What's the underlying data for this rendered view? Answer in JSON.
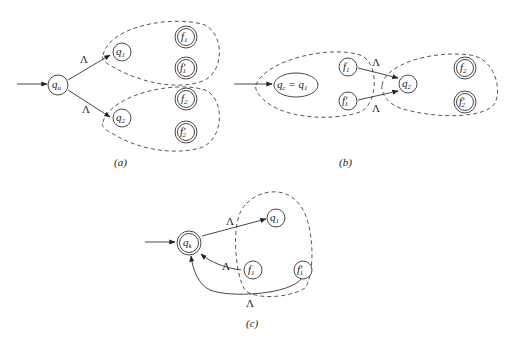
{
  "figure": {
    "panels": [
      {
        "id": "a",
        "caption": "(a)",
        "states": [
          {
            "id": "qu",
            "label": "q",
            "sub": "u",
            "type": "initial"
          },
          {
            "id": "q1",
            "label": "q",
            "sub": "1",
            "type": "normal"
          },
          {
            "id": "q2",
            "label": "q",
            "sub": "2",
            "type": "normal"
          },
          {
            "id": "f1",
            "label": "f",
            "sub": "1",
            "type": "accepting"
          },
          {
            "id": "f1p",
            "label": "f′",
            "sub": "1",
            "type": "accepting"
          },
          {
            "id": "f2",
            "label": "f",
            "sub": "2",
            "type": "accepting"
          },
          {
            "id": "f2p",
            "label": "f′",
            "sub": "2",
            "type": "accepting"
          }
        ],
        "transitions": [
          {
            "from": "qu",
            "to": "q1",
            "label": "Λ"
          },
          {
            "from": "qu",
            "to": "q2",
            "label": "Λ"
          }
        ],
        "groups": [
          "M1 (q1, f1, f1′)",
          "M2 (q2, f2, f2′)"
        ]
      },
      {
        "id": "b",
        "caption": "(b)",
        "states": [
          {
            "id": "qc",
            "label": "q",
            "sub": "c",
            "eq": "= q",
            "eqsub": "1",
            "type": "initial"
          },
          {
            "id": "f1",
            "label": "f",
            "sub": "1",
            "type": "normal"
          },
          {
            "id": "f1p",
            "label": "f′",
            "sub": "1",
            "type": "normal"
          },
          {
            "id": "q2",
            "label": "q",
            "sub": "2",
            "type": "normal"
          },
          {
            "id": "f2",
            "label": "f",
            "sub": "2",
            "type": "accepting"
          },
          {
            "id": "f2p",
            "label": "f′",
            "sub": "2",
            "type": "accepting"
          }
        ],
        "transitions": [
          {
            "from": "f1",
            "to": "q2",
            "label": "Λ"
          },
          {
            "from": "f1p",
            "to": "q2",
            "label": "Λ"
          }
        ],
        "groups": [
          "M1 (qc=q1, f1, f1′)",
          "M2 (q2, f2, f2′)"
        ]
      },
      {
        "id": "c",
        "caption": "(c)",
        "states": [
          {
            "id": "qk",
            "label": "q",
            "sub": "k",
            "type": "initial-accepting"
          },
          {
            "id": "q1",
            "label": "q",
            "sub": "1",
            "type": "normal"
          },
          {
            "id": "f1",
            "label": "f",
            "sub": "1",
            "type": "normal"
          },
          {
            "id": "f1p",
            "label": "f′",
            "sub": "1",
            "type": "normal"
          }
        ],
        "transitions": [
          {
            "from": "qk",
            "to": "q1",
            "label": "Λ"
          },
          {
            "from": "f1",
            "to": "qk",
            "label": "Λ"
          },
          {
            "from": "f1p",
            "to": "qk",
            "label": "Λ"
          }
        ],
        "groups": [
          "M1 (q1, f1, f1′)"
        ]
      }
    ]
  },
  "text": {
    "lambda": "Λ",
    "a": {
      "qu": "q",
      "qu_sub": "u",
      "q1": "q",
      "q1_sub": "1",
      "q2": "q",
      "q2_sub": "2",
      "f1": "f",
      "f1_sub": "1",
      "f1p": "f′",
      "f1p_sub": "1",
      "f2": "f",
      "f2_sub": "2",
      "f2p": "f′",
      "f2p_sub": "2",
      "caption": "(a)"
    },
    "b": {
      "qc": "q",
      "qc_sub": "c",
      "eq": " = q",
      "eq_sub": "1",
      "f1": "f",
      "f1_sub": "1",
      "f1p": "f′",
      "f1p_sub": "1",
      "q2": "q",
      "q2_sub": "2",
      "f2": "f",
      "f2_sub": "2",
      "f2p": "f′",
      "f2p_sub": "2",
      "caption": "(b)"
    },
    "c": {
      "qk": "q",
      "qk_sub": "k",
      "q1": "q",
      "q1_sub": "1",
      "f1": "f",
      "f1_sub": "1",
      "f1p": "f′",
      "f1p_sub": "1",
      "caption": "(c)"
    }
  }
}
